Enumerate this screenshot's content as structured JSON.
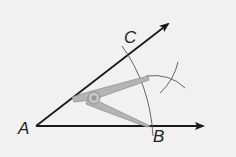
{
  "diagram": {
    "points": {
      "A": {
        "label": "A"
      },
      "B": {
        "label": "B"
      },
      "C": {
        "label": "C"
      }
    },
    "colors": {
      "background": "#f1f1f1",
      "ray": "#1a1a1a",
      "arc": "#555555",
      "compass": "#9a9a9a"
    }
  }
}
